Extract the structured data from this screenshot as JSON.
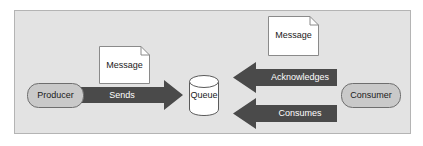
{
  "diagram": {
    "panel": {
      "background_color": "#e3e3e3",
      "border_color": "#b4b4b4"
    },
    "colors": {
      "arrow_fill": "#4a4a4a",
      "arrow_label_text": "#ffffff",
      "node_fill": "#c9c9c9",
      "node_border": "#6e6e6e",
      "node_text": "#1a1a1a",
      "document_fill": "#ffffff",
      "document_border": "#8a8a8a",
      "queue_fill": "#ffffff",
      "queue_border": "#5a5a5a"
    },
    "nodes": [
      {
        "id": "producer",
        "label": "Producer",
        "shape": "rounded-rectangle"
      },
      {
        "id": "queue",
        "label": "Queue",
        "shape": "cylinder"
      },
      {
        "id": "consumer",
        "label": "Consumer",
        "shape": "rounded-rectangle"
      }
    ],
    "documents": [
      {
        "id": "message-producer",
        "label": "Message",
        "shape": "document"
      },
      {
        "id": "message-consumer",
        "label": "Message",
        "shape": "document"
      }
    ],
    "arrows": [
      {
        "id": "sends",
        "label": "Sends",
        "from": "producer",
        "to": "queue",
        "direction": "right"
      },
      {
        "id": "acknowledges",
        "label": "Acknowledges",
        "from": "consumer",
        "to": "queue",
        "direction": "left"
      },
      {
        "id": "consumes",
        "label": "Consumes",
        "from": "consumer",
        "to": "queue",
        "direction": "left"
      }
    ]
  }
}
